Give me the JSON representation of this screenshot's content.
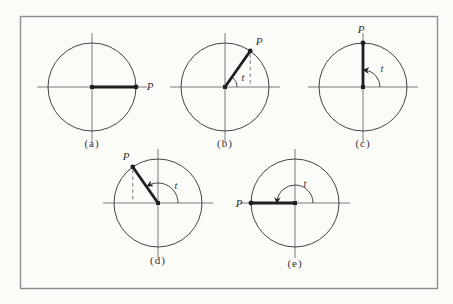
{
  "figure": {
    "type": "textbook-diagram"
  },
  "colors": {
    "background": "#fbfbf8",
    "frame": "#8d8d8d",
    "circle_line": "#424242",
    "axis_line": "#5a5a5a",
    "radius_line": "#1f1f1f",
    "dashed_line": "#6a6a6a",
    "text": "#333333"
  },
  "figures": [
    {
      "id": "a",
      "caption": "(a)",
      "point_label": "P",
      "angle_label": "",
      "angle_deg": 0,
      "has_angle_arc": false,
      "has_arrowhead": false,
      "has_dashed_projection": false
    },
    {
      "id": "b",
      "caption": "(b)",
      "point_label": "P",
      "angle_label": "t",
      "angle_deg": 55,
      "has_angle_arc": true,
      "has_arrowhead": false,
      "has_dashed_projection": true
    },
    {
      "id": "c",
      "caption": "(c)",
      "point_label": "P",
      "angle_label": "t",
      "angle_deg": 90,
      "has_angle_arc": true,
      "has_arrowhead": true,
      "has_dashed_projection": false
    },
    {
      "id": "d",
      "caption": "(d)",
      "point_label": "P",
      "angle_label": "t",
      "angle_deg": 125,
      "has_angle_arc": true,
      "has_arrowhead": true,
      "has_dashed_projection": true
    },
    {
      "id": "e",
      "caption": "(e)",
      "point_label": "P",
      "angle_label": "t",
      "angle_deg": 180,
      "has_angle_arc": true,
      "has_arrowhead": true,
      "has_dashed_projection": false
    }
  ]
}
